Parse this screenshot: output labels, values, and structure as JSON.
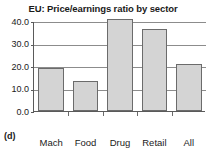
{
  "caption": "(d)",
  "chart_data": {
    "type": "bar",
    "title": "EU: Price/earnings ratio by sector",
    "xlabel": "",
    "ylabel": "",
    "categories": [
      "Mach",
      "Food",
      "Drug",
      "Retail",
      "All"
    ],
    "values": [
      19.0,
      13.2,
      41.0,
      36.5,
      21.0
    ],
    "ylim": [
      0.0,
      40.0
    ],
    "yticks": [
      0.0,
      10.0,
      20.0,
      30.0,
      40.0
    ],
    "ytick_labels": [
      "0.0",
      "10.0",
      "20.0",
      "30.0",
      "40.0"
    ],
    "grid": "horizontal",
    "legend": "none",
    "bar_fill_color": "#d4d4d4",
    "bar_border_color": "#6b6b6b",
    "axis_color": "#5a5a5a",
    "gridline_color": "#8c8c8c",
    "background_color": "#ffffff"
  }
}
